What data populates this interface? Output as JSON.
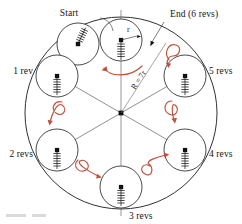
{
  "figure": {
    "title_alt": "Circle of radius r rolling inside circle of radius R = 7r, marking revolutions",
    "labels": {
      "start": "Start",
      "end": "End (6 revs)",
      "rev1": "1 rev",
      "rev2": "2 revs",
      "rev3": "3 revs",
      "rev4": "4 revs",
      "rev5": "5 revs",
      "radius_small": "r",
      "radius_big": "R = 7r"
    },
    "colors": {
      "ink": "#1a1a1a",
      "accent_red": "#c0503c",
      "construction_gray": "#6a6a6a",
      "background": "#ffffff"
    },
    "geometry": {
      "big_circle": {
        "cx": 121,
        "cy": 113,
        "r": 96
      },
      "small_circle_radius": 22,
      "positions": [
        {
          "name": "start",
          "label": "Start",
          "cx": 121,
          "cy": 40,
          "angle_deg": 90
        },
        {
          "name": "rev1",
          "label": "1 rev",
          "cx": 57,
          "cy": 76,
          "angle_deg": 150
        },
        {
          "name": "rev2",
          "label": "2 revs",
          "cx": 57,
          "cy": 150,
          "angle_deg": 210
        },
        {
          "name": "rev3",
          "label": "3 revs",
          "cx": 121,
          "cy": 187,
          "angle_deg": 270
        },
        {
          "name": "rev4",
          "label": "4 revs",
          "cx": 185,
          "cy": 150,
          "angle_deg": 330
        },
        {
          "name": "rev5",
          "label": "5 revs",
          "cx": 185,
          "cy": 76,
          "angle_deg": 30
        },
        {
          "name": "tilted",
          "label": "",
          "cx": 78,
          "cy": 44,
          "angle_deg": 115
        }
      ],
      "revolution_count": 6,
      "ratio_R_to_r": 7
    }
  }
}
